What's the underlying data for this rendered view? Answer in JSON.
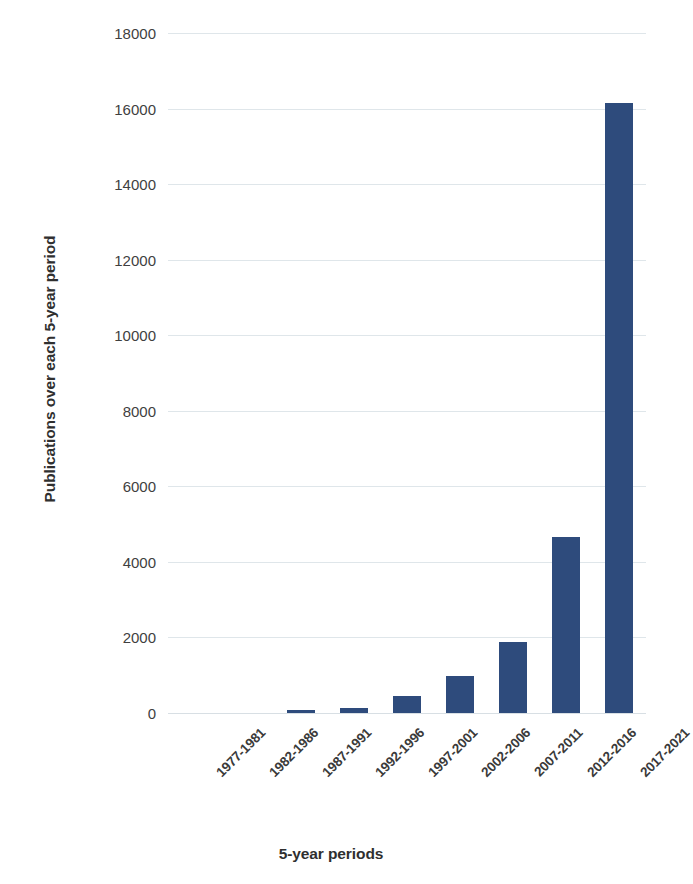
{
  "chart_data": {
    "type": "bar",
    "title": "",
    "xlabel": "5-year periods",
    "ylabel": "Publications over each 5-year period",
    "categories": [
      "1977-1981",
      "1982-1986",
      "1987-1991",
      "1992-1996",
      "1997-2001",
      "2002-2006",
      "2007-2011",
      "2012-2016",
      "2017-2021"
    ],
    "values": [
      0,
      0,
      80,
      140,
      460,
      970,
      1870,
      4650,
      16150
    ],
    "ylim": [
      0,
      18000
    ],
    "ytick_labels": [
      "0",
      "2000",
      "4000",
      "6000",
      "8000",
      "10000",
      "12000",
      "14000",
      "16000",
      "18000"
    ],
    "ytick_values": [
      0,
      2000,
      4000,
      6000,
      8000,
      10000,
      12000,
      14000,
      16000,
      18000
    ],
    "grid": true,
    "legend": "none",
    "bar_color": "#2e4b7c",
    "gridline_color": "#dfe6ea",
    "background_color": "#ffffff"
  }
}
